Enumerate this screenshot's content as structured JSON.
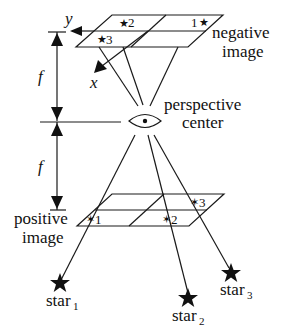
{
  "diagram": {
    "type": "star camera perspective projection",
    "labels": {
      "negative_image_line1": "negative",
      "negative_image_line2": "image",
      "perspective_center_line1": "perspective",
      "perspective_center_line2": "center",
      "positive_image_line1": "positive",
      "positive_image_line2": "image",
      "focal_length_top": "f",
      "focal_length_bottom": "f",
      "axis_x": "x",
      "axis_y": "y"
    },
    "negative_image_stars": [
      {
        "id": "1",
        "label": "1"
      },
      {
        "id": "2",
        "label": "2"
      },
      {
        "id": "3",
        "label": "3"
      }
    ],
    "positive_image_stars": [
      {
        "id": "1",
        "label": "1"
      },
      {
        "id": "2",
        "label": "2"
      },
      {
        "id": "3",
        "label": "3"
      }
    ],
    "stars": [
      {
        "name": "star",
        "sub": "1"
      },
      {
        "name": "star",
        "sub": "2"
      },
      {
        "name": "star",
        "sub": "3"
      }
    ],
    "colors": {
      "line": "#1a1a1a",
      "background": "#ffffff"
    }
  }
}
